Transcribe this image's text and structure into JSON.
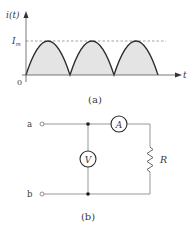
{
  "figure_a": {
    "caption": "(a)",
    "y_axis_label": "i(t)",
    "x_axis_label": "t",
    "origin_label": "0",
    "peak_label_main": "I",
    "peak_label_sub": "m",
    "waveform": "full-wave rectified sine (|sin|)",
    "num_half_cycles": 3,
    "fill_color": "#e3e3e3",
    "line_color": "#2a2a2a",
    "dashed_line_color": "#8a8a8a"
  },
  "figure_b": {
    "caption": "(b)",
    "terminal_a": "a",
    "terminal_b": "b",
    "ammeter_label": "A",
    "voltmeter_label": "V",
    "resistor_label": "R",
    "wire_color": "#8c8c8c",
    "node_color": "#1a1a1a"
  }
}
